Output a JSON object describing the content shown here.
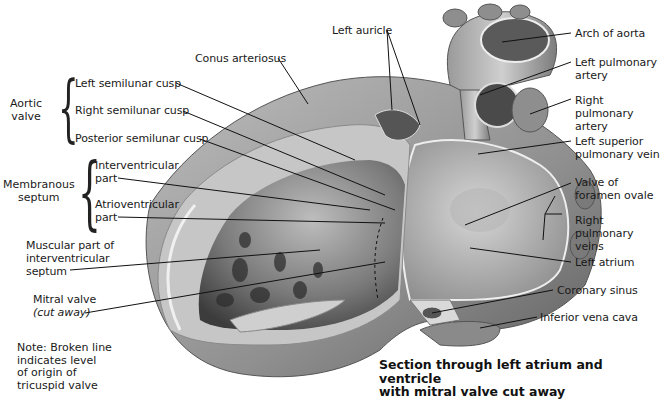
{
  "figure": {
    "caption": "Section through left atrium and ventricle\nwith mitral valve cut away",
    "note": "Note: Broken line\nindicates level\nof origin of\ntricuspid valve"
  },
  "groups": {
    "aortic_valve": "Aortic\nvalve",
    "membranous_septum": "Membranous\nseptum"
  },
  "labels_left": {
    "conus_arteriosus": "Conus arteriosus",
    "left_semilunar_cusp": "Left semilunar cusp",
    "right_semilunar_cusp": "Right semilunar cusp",
    "posterior_semilunar_cusp": "Posterior semilunar cusp",
    "interventricular_part": "Interventricular\npart",
    "atrioventricular_part": "Atrioventricular\npart",
    "muscular_part": "Muscular part of\ninterventricular\nseptum",
    "mitral_valve": "Mitral valve",
    "mitral_valve_sub": "(cut away)"
  },
  "labels_top": {
    "left_auricle": "Left auricle"
  },
  "labels_right": {
    "arch_of_aorta": "Arch of aorta",
    "left_pulmonary_artery": "Left pulmonary\nartery",
    "right_pulmonary_artery": "Right pulmonary\nartery",
    "left_superior_pulmonary_vein": "Left superior\npulmonary vein",
    "valve_of_foramen_ovale": "Valve of\nforamen ovale",
    "right_pulmonary_veins": "Right pulmonary\nveins",
    "left_atrium": "Left atrium",
    "coronary_sinus": "Coronary sinus",
    "inferior_vena_cava": "Inferior vena cava"
  },
  "colors": {
    "tissue_light": "#c9c9c9",
    "tissue_mid": "#9a9a9a",
    "tissue_dark": "#4a4a4a",
    "leader_line": "#111111"
  }
}
